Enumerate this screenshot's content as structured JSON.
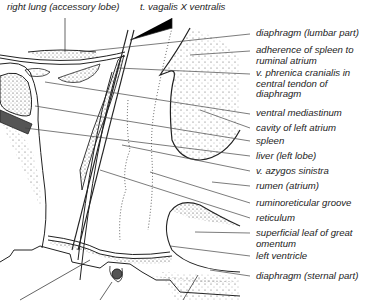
{
  "figure": {
    "type": "anatomical-illustration",
    "colors": {
      "line": "#222222",
      "stipple": "#333333",
      "fill_dark": "#555555",
      "background": "#ffffff"
    },
    "top_labels": [
      {
        "text": "right lung (accessory lobe)"
      },
      {
        "text": "t. vagalis X ventralis"
      }
    ],
    "right_labels": [
      {
        "text": "diaphragm (lumbar part)"
      },
      {
        "text": "adherence of spleen to ruminal atrium"
      },
      {
        "text": "v. phrenica cranialis in central tendon of diaphragm"
      },
      {
        "text": "ventral mediastinum"
      },
      {
        "text": "cavity of left atrium"
      },
      {
        "text": "spleen"
      },
      {
        "text": "liver (left lobe)"
      },
      {
        "text": "v. azygos sinistra"
      },
      {
        "text": "rumen (atrium)"
      },
      {
        "text": "ruminoreticular groove"
      },
      {
        "text": "reticulum"
      },
      {
        "text": "superficial leaf of great omentum"
      },
      {
        "text": "left ventricle"
      },
      {
        "text": "diaphragm (sternal part)"
      }
    ]
  }
}
